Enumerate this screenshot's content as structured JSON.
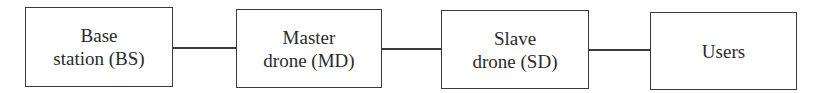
{
  "diagram": {
    "type": "block-flow",
    "nodes": [
      {
        "id": "bs",
        "line1": "Base",
        "line2": "station (BS)"
      },
      {
        "id": "md",
        "line1": "Master",
        "line2": "drone (MD)"
      },
      {
        "id": "sd",
        "line1": "Slave",
        "line2": "drone (SD)"
      },
      {
        "id": "users",
        "line1": "Users",
        "line2": ""
      }
    ],
    "edges": [
      {
        "from": "bs",
        "to": "md"
      },
      {
        "from": "md",
        "to": "sd"
      },
      {
        "from": "sd",
        "to": "users"
      }
    ],
    "colors": {
      "stroke": "#3a3a3a",
      "text": "#2a2a2a",
      "background": "#ffffff"
    }
  }
}
